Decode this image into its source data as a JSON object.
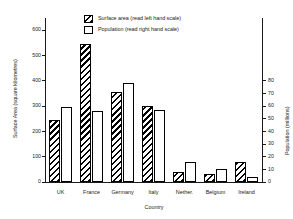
{
  "chart_data": {
    "type": "bar",
    "title": "",
    "subtitle": "",
    "xlabel": "Country",
    "ylabel": "Surface Area (square kilometres)",
    "y2label": "Population (millions)",
    "categories": [
      "UK",
      "France",
      "Germany",
      "Italy",
      "Nether.",
      "Belgium",
      "Ireland"
    ],
    "series": [
      {
        "name": "Surface area (read left hand scale)",
        "axis": "left",
        "fill": "diagonal-hatch",
        "values": [
          245,
          545,
          355,
          300,
          41,
          31,
          80
        ]
      },
      {
        "name": "Population (read right hand scale)",
        "axis": "right",
        "fill": "white",
        "values": [
          59,
          56,
          78,
          57,
          16,
          10,
          4
        ]
      }
    ],
    "ylim": [
      0,
      600
    ],
    "y2lim": [
      0,
      120
    ],
    "yticks": [
      0,
      100,
      200,
      300,
      400,
      500,
      600
    ],
    "y2ticks": [
      0,
      10,
      20,
      30,
      40,
      50,
      60,
      70,
      80
    ],
    "ytick_labels": [
      "0",
      "100",
      "200",
      "300",
      "400",
      "500",
      "600"
    ],
    "y2tick_labels": [
      "0",
      "10",
      "20",
      "30",
      "40",
      "50",
      "60",
      "70",
      "80"
    ],
    "grid": false,
    "legend_position": "top-center",
    "colors": {
      "axis": "#1a1a1a",
      "bar_outline": "#000000",
      "hatch": "#000000",
      "background": "#ffffff"
    }
  },
  "legend": {
    "items": [
      {
        "label": "Surface area (read left hand scale)",
        "swatch": "diagonal-hatch"
      },
      {
        "label": "Population (read right hand scale)",
        "swatch": "white"
      }
    ]
  }
}
